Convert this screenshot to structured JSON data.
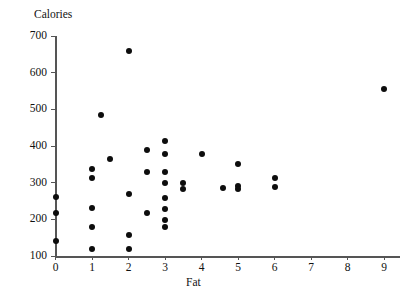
{
  "chart_data": {
    "type": "scatter",
    "title": "",
    "xlabel": "Fat",
    "ylabel": "Calories",
    "xlim": [
      -0.45,
      9.45
    ],
    "ylim": [
      90,
      710
    ],
    "grid": false,
    "legend": "none",
    "xticks": [
      0,
      1,
      2,
      3,
      4,
      5,
      6,
      7,
      8,
      9
    ],
    "xtick_labels": [
      "0",
      "1",
      "2",
      "3",
      "4",
      "5",
      "6",
      "7",
      "8",
      "9"
    ],
    "yticks": [
      100,
      200,
      300,
      400,
      500,
      600,
      700
    ],
    "ytick_labels": [
      "100",
      "200",
      "300",
      "400",
      "500",
      "600",
      "700"
    ],
    "marker": "filled-circle",
    "marker_color": "#0d0d0d",
    "marker_size": 6,
    "points": [
      {
        "x": 0.0,
        "y": 260
      },
      {
        "x": 0.0,
        "y": 218
      },
      {
        "x": 0.0,
        "y": 140
      },
      {
        "x": 1.0,
        "y": 338
      },
      {
        "x": 1.0,
        "y": 312
      },
      {
        "x": 1.0,
        "y": 230
      },
      {
        "x": 1.0,
        "y": 180
      },
      {
        "x": 1.0,
        "y": 120
      },
      {
        "x": 1.25,
        "y": 485
      },
      {
        "x": 1.5,
        "y": 365
      },
      {
        "x": 2.0,
        "y": 660
      },
      {
        "x": 2.0,
        "y": 268
      },
      {
        "x": 2.0,
        "y": 158
      },
      {
        "x": 2.0,
        "y": 120
      },
      {
        "x": 2.5,
        "y": 388
      },
      {
        "x": 2.5,
        "y": 328
      },
      {
        "x": 2.5,
        "y": 218
      },
      {
        "x": 3.0,
        "y": 415
      },
      {
        "x": 3.0,
        "y": 378
      },
      {
        "x": 3.0,
        "y": 328
      },
      {
        "x": 3.0,
        "y": 298
      },
      {
        "x": 3.0,
        "y": 258
      },
      {
        "x": 3.0,
        "y": 228
      },
      {
        "x": 3.0,
        "y": 198
      },
      {
        "x": 3.0,
        "y": 178
      },
      {
        "x": 3.5,
        "y": 298
      },
      {
        "x": 3.5,
        "y": 283
      },
      {
        "x": 4.0,
        "y": 378
      },
      {
        "x": 4.6,
        "y": 285
      },
      {
        "x": 5.0,
        "y": 352
      },
      {
        "x": 5.0,
        "y": 292
      },
      {
        "x": 5.0,
        "y": 282
      },
      {
        "x": 6.0,
        "y": 312
      },
      {
        "x": 6.0,
        "y": 288
      },
      {
        "x": 9.0,
        "y": 555
      }
    ]
  },
  "axes": {
    "y_title": "Calories",
    "x_title": "Fat"
  }
}
